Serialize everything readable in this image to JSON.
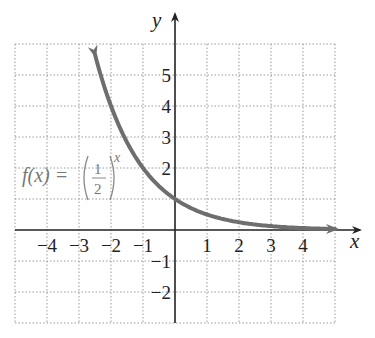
{
  "chart_data": {
    "type": "line",
    "title": "",
    "xlabel": "x",
    "ylabel": "y",
    "xlim": [
      -5,
      5
    ],
    "ylim": [
      -3,
      6
    ],
    "grid": true,
    "grid_style": "dotted",
    "x_ticks": [
      -4,
      -3,
      -2,
      -1,
      1,
      2,
      3,
      4
    ],
    "x_tick_labels": [
      "−4",
      "−3",
      "−2",
      "−1",
      "1",
      "2",
      "3",
      "4"
    ],
    "y_ticks": [
      5,
      4,
      3,
      2,
      -1,
      -2
    ],
    "y_tick_labels": [
      "5",
      "4",
      "3",
      "2",
      "−1",
      "−2"
    ],
    "series": [
      {
        "name": "f(x) = (1/2)^x",
        "function": "(1/2)^x",
        "color": "#6e6e6e",
        "domain": [
          -2.5,
          5
        ],
        "arrows": "both",
        "x": [
          -2.5,
          -2,
          -1,
          0,
          1,
          2,
          3,
          4,
          5
        ],
        "values": [
          5.66,
          4,
          2,
          1,
          0.5,
          0.25,
          0.125,
          0.0625,
          0.03125
        ]
      }
    ],
    "annotations": [
      {
        "text": "f(x) = (1/2)^x",
        "position": [
          -4.7,
          1.6
        ]
      }
    ]
  },
  "labels": {
    "x_axis": "x",
    "y_axis": "y",
    "function_name": "f(x) = ",
    "fraction_num": "1",
    "fraction_den": "2",
    "exponent": "x"
  },
  "colors": {
    "curve": "#6e6e6e",
    "axes": "#222222",
    "grid": "#9a9a9a",
    "label": "#777777"
  }
}
